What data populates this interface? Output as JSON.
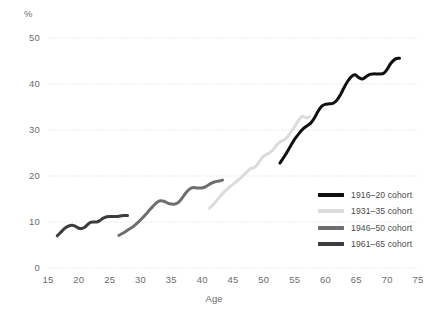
{
  "chart_data": {
    "type": "line",
    "title": "",
    "xlabel": "Age",
    "ylabel": "%",
    "xlim": [
      15,
      75
    ],
    "ylim": [
      0,
      50
    ],
    "xticks": [
      15,
      20,
      25,
      30,
      35,
      40,
      45,
      50,
      55,
      60,
      65,
      70,
      75
    ],
    "yticks": [
      0,
      10,
      20,
      30,
      40,
      50
    ],
    "grid": "horizontal-dotted",
    "legend_position": "bottom-right",
    "series": [
      {
        "name": "1916–20 cohort",
        "color": "#101010",
        "points": [
          [
            52.6,
            22.8
          ],
          [
            53.4,
            24.4
          ],
          [
            54.2,
            26.2
          ],
          [
            55.0,
            28.0
          ],
          [
            55.8,
            29.4
          ],
          [
            56.4,
            30.3
          ],
          [
            57.0,
            30.9
          ],
          [
            57.6,
            31.5
          ],
          [
            58.2,
            32.6
          ],
          [
            58.8,
            34.1
          ],
          [
            59.4,
            35.2
          ],
          [
            60.0,
            35.6
          ],
          [
            60.6,
            35.7
          ],
          [
            61.2,
            35.8
          ],
          [
            61.8,
            36.4
          ],
          [
            62.4,
            37.6
          ],
          [
            63.0,
            39.2
          ],
          [
            63.6,
            40.6
          ],
          [
            64.2,
            41.6
          ],
          [
            64.8,
            42.0
          ],
          [
            65.4,
            41.4
          ],
          [
            66.0,
            41.1
          ],
          [
            66.6,
            41.6
          ],
          [
            67.2,
            42.1
          ],
          [
            67.8,
            42.2
          ],
          [
            68.6,
            42.2
          ],
          [
            69.4,
            42.3
          ],
          [
            70.0,
            43.2
          ],
          [
            70.6,
            44.5
          ],
          [
            71.3,
            45.4
          ],
          [
            72.0,
            45.6
          ]
        ]
      },
      {
        "name": "1931–35 cohort",
        "color": "#dcdcdc",
        "points": [
          [
            41.2,
            13.0
          ],
          [
            42.0,
            14.1
          ],
          [
            42.8,
            15.4
          ],
          [
            43.6,
            16.6
          ],
          [
            44.4,
            17.6
          ],
          [
            45.2,
            18.4
          ],
          [
            46.0,
            19.3
          ],
          [
            46.8,
            20.3
          ],
          [
            47.4,
            21.1
          ],
          [
            47.9,
            21.6
          ],
          [
            48.4,
            21.8
          ],
          [
            48.9,
            22.4
          ],
          [
            49.4,
            23.4
          ],
          [
            49.9,
            24.2
          ],
          [
            50.4,
            24.7
          ],
          [
            50.9,
            25.0
          ],
          [
            51.4,
            25.6
          ],
          [
            51.9,
            26.4
          ],
          [
            52.4,
            27.2
          ],
          [
            52.9,
            27.6
          ],
          [
            53.4,
            27.9
          ],
          [
            53.9,
            28.6
          ],
          [
            54.4,
            29.6
          ],
          [
            54.9,
            30.5
          ],
          [
            55.3,
            31.4
          ],
          [
            55.8,
            32.4
          ],
          [
            56.3,
            33.0
          ],
          [
            56.9,
            32.6
          ],
          [
            57.4,
            32.9
          ]
        ]
      },
      {
        "name": "1946–50 cohort",
        "color": "#6e6e70",
        "points": [
          [
            26.5,
            7.1
          ],
          [
            27.2,
            7.6
          ],
          [
            28.0,
            8.3
          ],
          [
            28.8,
            9.0
          ],
          [
            29.6,
            9.9
          ],
          [
            30.4,
            11.0
          ],
          [
            31.2,
            12.2
          ],
          [
            32.0,
            13.4
          ],
          [
            32.6,
            14.2
          ],
          [
            33.2,
            14.6
          ],
          [
            33.8,
            14.5
          ],
          [
            34.4,
            14.1
          ],
          [
            35.0,
            13.9
          ],
          [
            35.6,
            13.9
          ],
          [
            36.2,
            14.3
          ],
          [
            36.8,
            15.3
          ],
          [
            37.4,
            16.4
          ],
          [
            38.0,
            17.2
          ],
          [
            38.6,
            17.5
          ],
          [
            39.2,
            17.4
          ],
          [
            39.9,
            17.4
          ],
          [
            40.6,
            17.7
          ],
          [
            41.3,
            18.3
          ],
          [
            42.0,
            18.7
          ],
          [
            42.7,
            18.9
          ],
          [
            43.3,
            19.1
          ]
        ]
      },
      {
        "name": "1961–65 cohort",
        "color": "#3c3c3e",
        "points": [
          [
            16.5,
            7.0
          ],
          [
            17.1,
            7.8
          ],
          [
            17.7,
            8.6
          ],
          [
            18.3,
            9.1
          ],
          [
            18.9,
            9.3
          ],
          [
            19.4,
            9.1
          ],
          [
            19.9,
            8.7
          ],
          [
            20.4,
            8.6
          ],
          [
            20.9,
            8.8
          ],
          [
            21.4,
            9.4
          ],
          [
            21.9,
            9.9
          ],
          [
            22.4,
            10.0
          ],
          [
            22.9,
            10.0
          ],
          [
            23.4,
            10.3
          ],
          [
            23.9,
            10.8
          ],
          [
            24.4,
            11.1
          ],
          [
            24.9,
            11.2
          ],
          [
            25.5,
            11.2
          ],
          [
            26.1,
            11.2
          ],
          [
            26.7,
            11.3
          ],
          [
            27.3,
            11.4
          ],
          [
            27.9,
            11.4
          ]
        ]
      }
    ]
  },
  "legend": {
    "items": [
      {
        "label": "1916–20 cohort",
        "color": "#101010"
      },
      {
        "label": "1931–35 cohort",
        "color": "#dcdcdc"
      },
      {
        "label": "1946–50 cohort",
        "color": "#6e6e70"
      },
      {
        "label": "1961–65 cohort",
        "color": "#3c3c3e"
      }
    ]
  },
  "axes": {
    "y_unit_label": "%",
    "x_axis_title": "Age",
    "y_tick_labels": [
      "0",
      "10",
      "20",
      "30",
      "40",
      "50"
    ],
    "x_tick_labels": [
      "15",
      "20",
      "25",
      "30",
      "35",
      "40",
      "45",
      "50",
      "55",
      "60",
      "65",
      "70",
      "75"
    ]
  },
  "colors": {
    "grid": "#e6e6e6",
    "axis_text": "#6b6b6d",
    "background": "#ffffff"
  }
}
